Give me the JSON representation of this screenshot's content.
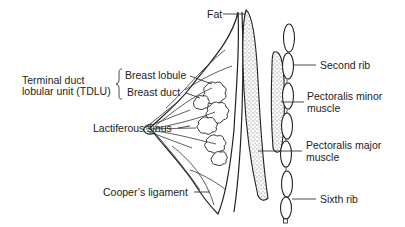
{
  "figure": {
    "labels": {
      "fat": "Fat",
      "second_rib": "Second rib",
      "pectoralis_minor_line1": "Pectoralis minor",
      "pectoralis_minor_line2": "muscle",
      "pectoralis_major_line1": "Pectoralis major",
      "pectoralis_major_line2": "muscle",
      "sixth_rib": "Sixth rib",
      "tdlu_line1": "Terminal duct",
      "tdlu_line2": "lobular unit (TDLU)",
      "breast_lobule": "Breast lobule",
      "breast_duct": "Breast duct",
      "lactiferous_sinus": "Lactiferous sinus",
      "coopers_ligament": "Cooper’s ligament"
    },
    "colors": {
      "line": "#222222",
      "stipple": "#555555",
      "background": "#ffffff"
    }
  }
}
